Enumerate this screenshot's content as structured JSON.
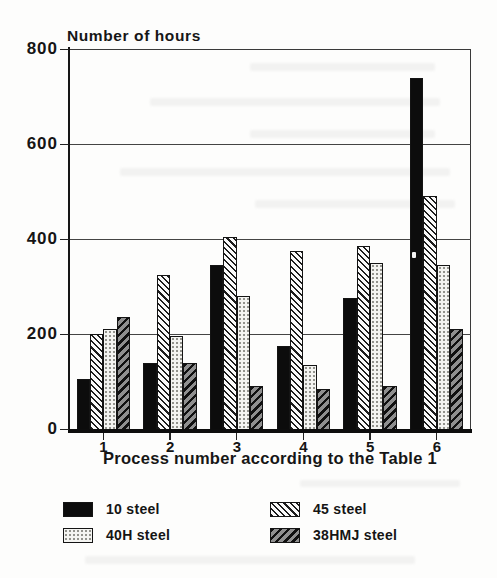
{
  "chart_data": {
    "type": "bar",
    "title": "Number of hours",
    "xlabel": "Process number according to the Table 1",
    "ylabel": "",
    "categories": [
      "1",
      "2",
      "3",
      "4",
      "5",
      "6"
    ],
    "series": [
      {
        "name": "10 steel",
        "pattern": "solid-black",
        "values": [
          105,
          140,
          345,
          175,
          275,
          740
        ]
      },
      {
        "name": "45 steel",
        "pattern": "hatch-light",
        "values": [
          200,
          325,
          405,
          375,
          385,
          490
        ]
      },
      {
        "name": "40H steel",
        "pattern": "dots-light",
        "values": [
          210,
          195,
          280,
          135,
          350,
          345
        ]
      },
      {
        "name": "38HMJ steel",
        "pattern": "hatch-dark",
        "values": [
          235,
          140,
          90,
          85,
          90,
          210
        ]
      }
    ],
    "ylim": [
      0,
      800
    ],
    "yticks": [
      0,
      200,
      400,
      600,
      800
    ],
    "grid": true,
    "legend_position": "bottom",
    "legend": [
      {
        "label": "10 steel",
        "pattern": "solid-black"
      },
      {
        "label": "45 steel",
        "pattern": "hatch-light"
      },
      {
        "label": "40H steel",
        "pattern": "dots-light"
      },
      {
        "label": "38HMJ steel",
        "pattern": "hatch-dark"
      }
    ],
    "colors": {
      "bar_black": "#0c0c0c",
      "hatch_line": "#1d1d1d",
      "dots_bg": "#f4f4f1",
      "hatch_dark_bg": "#8f8f8f",
      "axis": "#161616",
      "background": "#fdfdfc"
    }
  }
}
